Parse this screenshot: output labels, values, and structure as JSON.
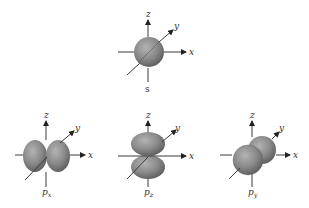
{
  "diagram": {
    "colors": {
      "lobe_light": "#a6a6a6",
      "lobe_mid": "#7d7d7d",
      "lobe_dark": "#555555",
      "axis": "#3a3a3a",
      "background": "#ffffff"
    },
    "axes": {
      "x": "x",
      "y": "y",
      "z": "z"
    },
    "orbitals": [
      {
        "id": "s",
        "label": "s",
        "subscript": "",
        "shape": "sphere"
      },
      {
        "id": "px",
        "label": "p",
        "subscript": "x",
        "shape": "two lobes along x-axis"
      },
      {
        "id": "pz",
        "label": "p",
        "subscript": "z",
        "shape": "two lobes along z-axis"
      },
      {
        "id": "py",
        "label": "p",
        "subscript": "y",
        "shape": "two lobes along y-axis"
      }
    ]
  }
}
